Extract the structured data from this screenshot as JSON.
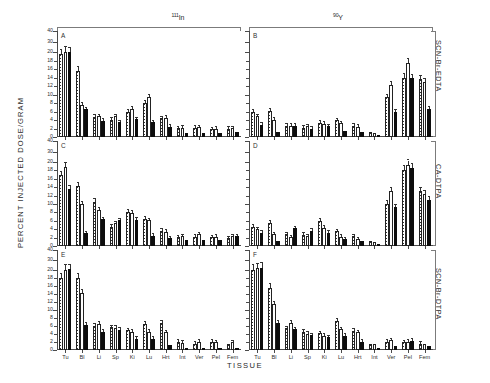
{
  "figure": {
    "y_axis_title": "PERCENT INJECTED DOSE/GRAM",
    "x_axis_title": "TISSUE",
    "column_headers": [
      {
        "isotope_mass": "111",
        "isotope_symbol": "In"
      },
      {
        "isotope_mass": "90",
        "isotope_symbol": "Y"
      }
    ],
    "row_labels": [
      "SCN-Br-EDTA",
      "CA-DTPA",
      "SCN-Br-DTPA"
    ],
    "panel_letters": [
      "A",
      "B",
      "C",
      "D",
      "E",
      "F"
    ],
    "y_tick_labels": [
      "0",
      "2",
      "4",
      "6",
      "8",
      "10",
      "12",
      "14",
      "16",
      "18",
      "20",
      "30",
      "40"
    ],
    "x_tick_labels": [
      "Tu",
      "Bl",
      "Li",
      "Sp",
      "Ki",
      "Lu",
      "Hrt",
      "Int",
      "Ver",
      "Pel",
      "Fem"
    ]
  },
  "chart_data": {
    "type": "bar",
    "xlabel": "TISSUE",
    "ylabel": "PERCENT INJECTED DOSE/GRAM",
    "categories": [
      "Tu",
      "Bl",
      "Li",
      "Sp",
      "Ki",
      "Lu",
      "Hrt",
      "Int",
      "Ver",
      "Pel",
      "Fem"
    ],
    "ylim": [
      0,
      40
    ],
    "y_ticks": [
      0,
      2,
      4,
      6,
      8,
      10,
      12,
      14,
      16,
      18,
      20,
      30,
      40
    ],
    "y_axis_break_note": "Scale is compressed above 20; ticks at 30 and 40 are log-like/compressed",
    "grid": false,
    "legend_position": "none",
    "series_names": [
      "stippled",
      "open",
      "solid"
    ],
    "panels": [
      {
        "letter": "A",
        "isotope": "111In",
        "conjugate": "SCN-Br-EDTA",
        "series": [
          {
            "name": "stippled",
            "values": [
              19.5,
              15.6,
              4.7,
              4.0,
              6.0,
              8.0,
              4.4,
              2.1,
              2.2,
              1.8,
              2.0
            ]
          },
          {
            "name": "open",
            "values": [
              20.6,
              7.6,
              4.9,
              4.9,
              6.6,
              9.4,
              4.5,
              2.2,
              2.3,
              1.9,
              2.1
            ]
          },
          {
            "name": "solid",
            "values": [
              20.2,
              6.5,
              3.8,
              3.5,
              4.2,
              3.5,
              2.4,
              0.9,
              1.0,
              1.0,
              1.1
            ]
          }
        ]
      },
      {
        "letter": "B",
        "isotope": "90Y",
        "conjugate": "SCN-Br-EDTA",
        "series": [
          {
            "name": "stippled",
            "values": [
              5.9,
              6.2,
              2.6,
              2.2,
              3.4,
              3.9,
              2.6,
              1.2,
              9.4,
              14.0,
              13.6
            ]
          },
          {
            "name": "open",
            "values": [
              4.9,
              4.0,
              2.7,
              2.5,
              3.1,
              3.2,
              2.4,
              1.0,
              12.2,
              17.5,
              13.0
            ]
          },
          {
            "name": "solid",
            "values": [
              2.9,
              1.2,
              2.7,
              1.9,
              2.5,
              1.5,
              1.2,
              0.4,
              6.0,
              13.9,
              6.6
            ]
          }
        ]
      },
      {
        "letter": "C",
        "isotope": "111In",
        "conjugate": "CA-DTPA",
        "series": [
          {
            "name": "stippled",
            "values": [
              16.8,
              14.2,
              10.5,
              4.6,
              8.2,
              6.5,
              3.6,
              2.1,
              2.2,
              2.1,
              1.8
            ]
          },
          {
            "name": "open",
            "values": [
              18.8,
              10.0,
              8.6,
              5.4,
              7.8,
              6.1,
              3.4,
              2.3,
              2.8,
              2.2,
              2.3
            ]
          },
          {
            "name": "solid",
            "values": [
              13.6,
              3.0,
              6.4,
              6.1,
              6.2,
              2.5,
              1.8,
              1.4,
              1.5,
              1.5,
              2.3
            ]
          }
        ]
      },
      {
        "letter": "D",
        "isotope": "90Y",
        "conjugate": "CA-DTPA",
        "series": [
          {
            "name": "stippled",
            "values": [
              4.6,
              5.5,
              2.8,
              2.7,
              6.0,
              3.5,
              2.3,
              1.2,
              10.1,
              18.0,
              13.2
            ]
          },
          {
            "name": "open",
            "values": [
              4.0,
              2.8,
              2.1,
              2.3,
              4.3,
              2.2,
              1.6,
              1.0,
              13.2,
              19.3,
              12.4
            ]
          },
          {
            "name": "solid",
            "values": [
              3.1,
              1.2,
              4.2,
              3.6,
              3.2,
              1.6,
              1.2,
              0.3,
              9.3,
              18.5,
              11.0
            ]
          }
        ]
      },
      {
        "letter": "E",
        "isotope": "111In",
        "conjugate": "SCN-Br-DTPA",
        "series": [
          {
            "name": "stippled",
            "values": [
              18.0,
              18.0,
              6.1,
              5.7,
              4.9,
              6.6,
              6.8,
              2.0,
              1.6,
              2.0,
              1.5
            ]
          },
          {
            "name": "open",
            "values": [
              20.5,
              14.2,
              6.6,
              5.5,
              4.5,
              4.6,
              4.4,
              1.8,
              2.1,
              1.9,
              1.9
            ]
          },
          {
            "name": "solid",
            "values": [
              20.8,
              6.3,
              4.6,
              5.0,
              2.8,
              2.8,
              1.3,
              0.4,
              0.5,
              0.4,
              0.6
            ]
          }
        ]
      },
      {
        "letter": "F",
        "isotope": "90Y",
        "conjugate": "SCN-Br-DTPA",
        "series": [
          {
            "name": "stippled",
            "values": [
              20.3,
              15.6,
              5.4,
              4.5,
              4.2,
              7.3,
              4.8,
              1.4,
              2.0,
              1.9,
              1.6
            ]
          },
          {
            "name": "open",
            "values": [
              22.0,
              11.4,
              6.8,
              4.0,
              3.6,
              5.2,
              4.4,
              1.5,
              2.4,
              2.1,
              1.5
            ]
          },
          {
            "name": "solid",
            "values": [
              22.5,
              6.8,
              5.2,
              3.7,
              3.2,
              3.6,
              2.1,
              0.6,
              1.1,
              2.3,
              0.9
            ]
          }
        ]
      }
    ]
  }
}
